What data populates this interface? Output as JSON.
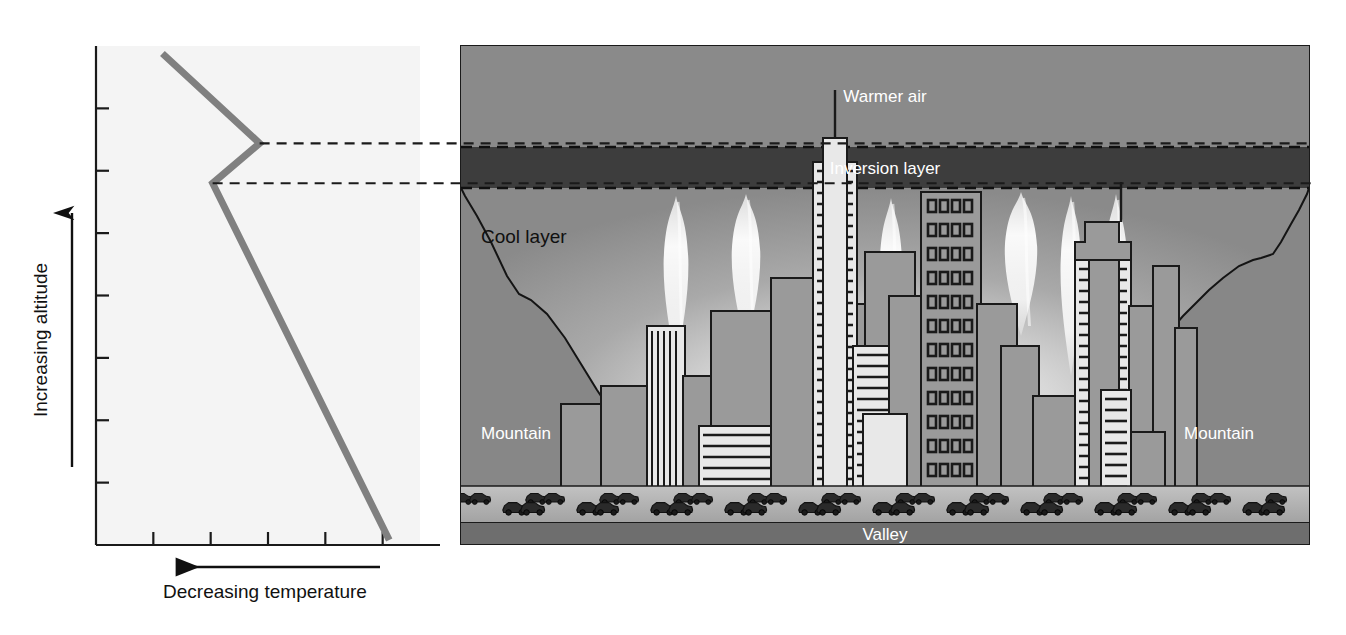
{
  "figure": {
    "background_color": "#ffffff"
  },
  "chart_data": {
    "type": "line",
    "title": "",
    "xlabel": "Decreasing temperature",
    "ylabel": "Increasing altitude",
    "xlabel_arrow_direction": "left",
    "ylabel_arrow_direction": "up",
    "x_axis_direction_note": "temperature decreases to the left",
    "grid": false,
    "legend": null,
    "x_tick_count": 5,
    "y_tick_count": 7,
    "xlim": [
      0,
      1
    ],
    "ylim": [
      0,
      1
    ],
    "series": [
      {
        "name": "Temperature profile",
        "color": "#808080",
        "line_width": 7,
        "points": [
          {
            "x": 0.205,
            "y": 0.985,
            "label": "top of profile"
          },
          {
            "x": 0.505,
            "y": 0.805,
            "label": "top of inversion layer"
          },
          {
            "x": 0.36,
            "y": 0.725,
            "label": "base of inversion layer"
          },
          {
            "x": 0.905,
            "y": 0.01,
            "label": "surface"
          }
        ]
      }
    ],
    "annotations": [
      {
        "type": "dashed-connector",
        "from": "top of inversion layer",
        "to": "inversion layer top boundary"
      },
      {
        "type": "dashed-connector",
        "from": "base of inversion layer",
        "to": "inversion layer bottom boundary"
      }
    ]
  },
  "scene": {
    "layers": [
      {
        "name": "warmer-air",
        "label": "Warmer air",
        "color": "#8a8a8a",
        "label_color": "#ffffff"
      },
      {
        "name": "inversion-layer",
        "label": "Inversion layer",
        "color": "#3d3d3d",
        "label_color": "#ffffff"
      },
      {
        "name": "cool-layer",
        "label": "Cool layer",
        "color": "#8d8d8d",
        "label_color": "#101010"
      },
      {
        "name": "valley",
        "label": "Valley",
        "color": "#6e6e6e",
        "label_color": "#ffffff"
      }
    ],
    "mountain_left_label": "Mountain",
    "mountain_right_label": "Mountain",
    "mountain_color": "#878787",
    "road_color": "#b0b0b0",
    "building_fill": "#9a9a9a",
    "building_light_fill": "#e8e8e8",
    "building_outline": "#1a1a1a",
    "smoke_color": "#f5f5f5",
    "smoke_plume_count": 7,
    "car_count": 46,
    "building_count": 22
  },
  "colors": {
    "plot_bg": "#f4f4f4",
    "axis": "#1a1a1a",
    "line": "#808080",
    "dashed": "#1a1a1a"
  }
}
